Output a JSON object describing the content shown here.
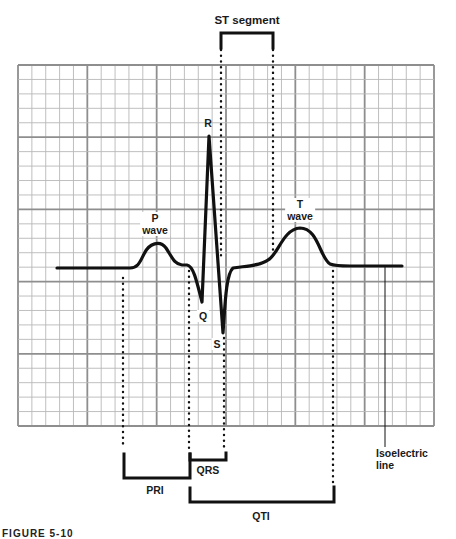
{
  "diagram": {
    "caption": "FIGURE 5-10",
    "grid": {
      "major_columns": 6,
      "major_rows": 5,
      "minor_per_major": 5,
      "minor_color": "#b8b8b8",
      "major_color": "#8e8e8e"
    },
    "trace_color": "#111111",
    "labels": {
      "st_segment": "ST segment",
      "r": "R",
      "q": "Q",
      "s": "S",
      "p_title": "P",
      "p_sub": "wave",
      "t_title": "T",
      "t_sub": "wave",
      "isoelectric_1": "Isoelectric",
      "isoelectric_2": "line",
      "pri": "PRI",
      "qrs": "QRS",
      "qti": "QTI"
    },
    "intervals": [
      {
        "name": "PRI",
        "description": "PR interval",
        "from": "P wave onset",
        "to": "QRS onset"
      },
      {
        "name": "QRS",
        "description": "QRS complex duration",
        "from": "Q onset",
        "to": "S end"
      },
      {
        "name": "QTI",
        "description": "QT interval",
        "from": "QRS onset",
        "to": "T wave end"
      },
      {
        "name": "ST segment",
        "description": "from end of S to start of T",
        "from": "S end",
        "to": "T onset"
      }
    ],
    "waves": [
      "P wave",
      "Q",
      "R",
      "S",
      "T wave"
    ]
  }
}
